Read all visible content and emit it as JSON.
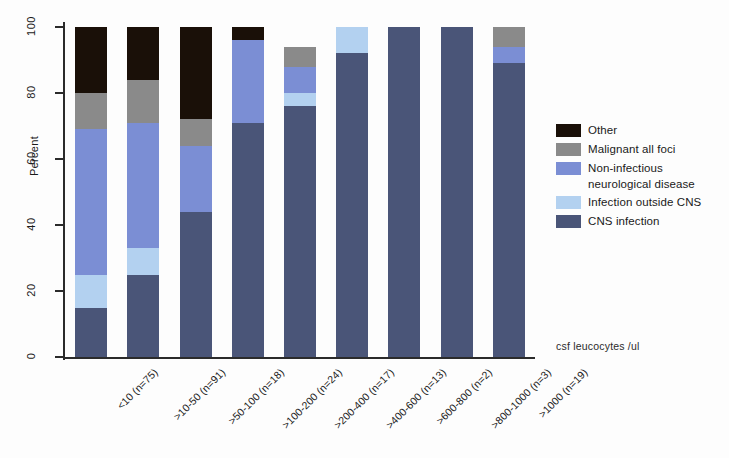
{
  "chart_data": {
    "type": "bar",
    "title": "",
    "subtitle": "",
    "xlabel": "csf leucocytes /ul",
    "ylabel": "Percent",
    "ylim": [
      0,
      100
    ],
    "yticks": [
      0,
      20,
      40,
      60,
      80,
      100
    ],
    "ytick_labels": [
      "0",
      "20",
      "40",
      "60",
      "80",
      "100"
    ],
    "grid": false,
    "stacked": true,
    "legend_position": "right",
    "categories": [
      "<10 (n=75)",
      ">10-50 (n=91)",
      ">50-100 (n=18)",
      ">100-200 (n=24)",
      ">200-400 (n=17)",
      ">400-600 (n=13)",
      ">600-800 (n=2)",
      ">800-1000 (n=3)",
      ">1000 (n=19)"
    ],
    "series": [
      {
        "name": "CNS infection",
        "color": "#4a5578",
        "values": [
          15,
          25,
          44,
          71,
          76,
          92,
          100,
          100,
          89
        ]
      },
      {
        "name": "Infection outside CNS",
        "color": "#b3d1f0",
        "values": [
          10,
          8,
          0,
          0,
          4,
          8,
          0,
          0,
          0
        ]
      },
      {
        "name": "Non-infectious neurological disease",
        "color": "#7b8ed4",
        "values": [
          44,
          38,
          20,
          25,
          8,
          0,
          0,
          0,
          5
        ]
      },
      {
        "name": "Malignant all foci",
        "color": "#8a8a8a",
        "values": [
          11,
          13,
          8,
          0,
          6,
          0,
          0,
          0,
          6
        ]
      },
      {
        "name": "Other",
        "color": "#1a1008",
        "values": [
          20,
          16,
          28,
          4,
          0,
          0,
          0,
          0,
          0
        ]
      }
    ]
  },
  "legend": {
    "entries": [
      {
        "label": "Other",
        "label_line2": "",
        "color": "#1a1008",
        "name": "other"
      },
      {
        "label": "Malignant all foci",
        "label_line2": "",
        "color": "#8a8a8a",
        "name": "malignant-all-foci"
      },
      {
        "label": "Non-infectious",
        "label_line2": "neurological disease",
        "color": "#7b8ed4",
        "name": "non-infectious-neurological-disease"
      },
      {
        "label": "Infection outside CNS",
        "label_line2": "",
        "color": "#b3d1f0",
        "name": "infection-outside-cns"
      },
      {
        "label": "CNS infection",
        "label_line2": "",
        "color": "#4a5578",
        "name": "cns-infection"
      }
    ]
  }
}
